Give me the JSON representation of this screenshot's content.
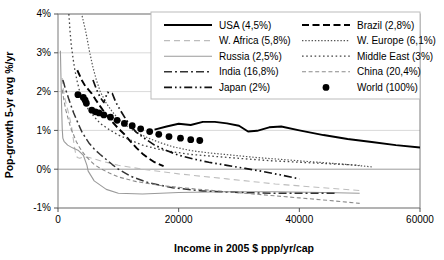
{
  "chart_data": {
    "type": "line",
    "title": "",
    "xlabel": "Income in 2005 $ ppp/yr/cap",
    "ylabel": "Pop-growth 5-yr avg %/yr",
    "xlim": [
      0,
      60000
    ],
    "ylim": [
      -1,
      4
    ],
    "xticks": [
      0,
      20000,
      40000,
      60000
    ],
    "xtick_labels": [
      "0",
      "20000",
      "40000",
      "60000"
    ],
    "yticks": [
      -1,
      0,
      1,
      2,
      3,
      4
    ],
    "ytick_labels": [
      "-1%",
      "0%",
      "1%",
      "2%",
      "3%",
      "4%"
    ],
    "grid": "horizontal",
    "legend_position": "top-right-inside",
    "series": [
      {
        "name": "USA (4,5%)",
        "key": "usa",
        "style": "solid-thick",
        "color": "#000000",
        "points": [
          [
            16000,
            1.02
          ],
          [
            18000,
            1.1
          ],
          [
            20000,
            1.17
          ],
          [
            22000,
            1.14
          ],
          [
            24000,
            1.22
          ],
          [
            26000,
            1.22
          ],
          [
            28000,
            1.18
          ],
          [
            30000,
            1.12
          ],
          [
            31500,
            0.97
          ],
          [
            33000,
            0.99
          ],
          [
            35000,
            1.08
          ],
          [
            37000,
            1.1
          ],
          [
            40000,
            1.0
          ],
          [
            44000,
            0.88
          ],
          [
            48000,
            0.78
          ],
          [
            52000,
            0.7
          ],
          [
            56000,
            0.62
          ],
          [
            60000,
            0.56
          ]
        ]
      },
      {
        "name": "Brazil (2,8%)",
        "key": "brazil",
        "style": "dashed-thick",
        "color": "#000000",
        "points": [
          [
            3200,
            2.55
          ],
          [
            4000,
            2.28
          ],
          [
            4600,
            2.12
          ],
          [
            5000,
            2.06
          ],
          [
            5600,
            1.95
          ],
          [
            6200,
            1.8
          ],
          [
            7000,
            1.62
          ],
          [
            8000,
            1.4
          ],
          [
            9000,
            1.22
          ],
          [
            10000,
            1.05
          ],
          [
            11000,
            0.9
          ],
          [
            12000,
            0.72
          ],
          [
            13000,
            0.55
          ],
          [
            14000,
            0.4
          ],
          [
            15000,
            0.28
          ],
          [
            16000,
            0.18
          ],
          [
            17500,
            0.08
          ]
        ]
      },
      {
        "name": "W. Africa (5,8%)",
        "key": "wafrica",
        "style": "dashed-light",
        "color": "#bdbdbd",
        "points": [
          [
            700,
            2.35
          ],
          [
            900,
            2.05
          ],
          [
            1100,
            1.85
          ],
          [
            1300,
            1.72
          ],
          [
            1500,
            1.6
          ],
          [
            1700,
            1.48
          ],
          [
            1900,
            1.35
          ],
          [
            2100,
            1.2
          ],
          [
            2300,
            1.05
          ],
          [
            2500,
            0.82
          ],
          [
            2700,
            0.6
          ],
          [
            2900,
            0.42
          ],
          [
            3200,
            0.3
          ],
          [
            3600,
            0.28
          ],
          [
            4200,
            0.32
          ],
          [
            5200,
            0.3
          ],
          [
            7000,
            0.22
          ],
          [
            10000,
            0.1
          ],
          [
            14000,
            0.0
          ],
          [
            20000,
            -0.12
          ],
          [
            28000,
            -0.25
          ],
          [
            36000,
            -0.38
          ],
          [
            44000,
            -0.48
          ],
          [
            50000,
            -0.55
          ]
        ]
      },
      {
        "name": "W. Europe (6,1%)",
        "key": "weurope",
        "style": "dotted-fine",
        "color": "#555555",
        "points": [
          [
            4000,
            3.95
          ],
          [
            4600,
            3.55
          ],
          [
            5200,
            3.05
          ],
          [
            5800,
            2.62
          ],
          [
            6400,
            2.28
          ],
          [
            7000,
            2.0
          ],
          [
            8000,
            1.7
          ],
          [
            9000,
            1.48
          ],
          [
            10000,
            1.3
          ],
          [
            11500,
            1.1
          ],
          [
            13000,
            0.95
          ],
          [
            15000,
            0.8
          ],
          [
            17000,
            0.68
          ],
          [
            19000,
            0.58
          ],
          [
            22000,
            0.48
          ],
          [
            25000,
            0.42
          ],
          [
            29000,
            0.36
          ],
          [
            33000,
            0.3
          ],
          [
            38000,
            0.24
          ],
          [
            43000,
            0.18
          ],
          [
            48000,
            0.12
          ],
          [
            52000,
            0.06
          ]
        ]
      },
      {
        "name": "Russia (2,5%)",
        "key": "russia",
        "style": "solid-light",
        "color": "#9a9a9a",
        "points": [
          [
            400,
            3.05
          ],
          [
            500,
            2.3
          ],
          [
            600,
            1.6
          ],
          [
            700,
            1.05
          ],
          [
            800,
            0.8
          ],
          [
            1000,
            0.72
          ],
          [
            1600,
            0.62
          ],
          [
            2400,
            0.55
          ],
          [
            3400,
            0.48
          ],
          [
            4200,
            0.36
          ],
          [
            4800,
            0.1
          ],
          [
            5000,
            -0.05
          ],
          [
            6000,
            -0.3
          ],
          [
            8000,
            -0.52
          ],
          [
            10000,
            -0.62
          ],
          [
            14000,
            -0.64
          ],
          [
            20000,
            -0.6
          ],
          [
            28000,
            -0.58
          ],
          [
            36000,
            -0.58
          ],
          [
            44000,
            -0.6
          ],
          [
            50000,
            -0.62
          ]
        ]
      },
      {
        "name": "Middle East (3%)",
        "key": "mideast",
        "style": "dotted-coarse",
        "color": "#444444",
        "points": [
          [
            1800,
            4.0
          ],
          [
            2000,
            3.55
          ],
          [
            2200,
            3.2
          ],
          [
            2500,
            2.85
          ],
          [
            2800,
            2.55
          ],
          [
            3200,
            2.25
          ],
          [
            3600,
            2.0
          ],
          [
            4200,
            1.78
          ],
          [
            5000,
            1.55
          ],
          [
            6000,
            1.35
          ],
          [
            7000,
            1.18
          ],
          [
            8500,
            1.02
          ],
          [
            10000,
            0.88
          ],
          [
            12000,
            0.75
          ],
          [
            14000,
            0.62
          ],
          [
            16500,
            0.52
          ],
          [
            19000,
            0.45
          ],
          [
            22000,
            0.38
          ],
          [
            26000,
            0.33
          ],
          [
            30000,
            0.28
          ],
          [
            35000,
            0.22
          ],
          [
            40000,
            0.18
          ],
          [
            45000,
            0.14
          ],
          [
            50000,
            0.1
          ]
        ]
      },
      {
        "name": "India (16,8%)",
        "key": "india",
        "style": "dashdot",
        "color": "#333333",
        "points": [
          [
            800,
            2.3
          ],
          [
            1000,
            2.2
          ],
          [
            1200,
            2.08
          ],
          [
            1500,
            1.95
          ],
          [
            1800,
            1.8
          ],
          [
            2200,
            1.62
          ],
          [
            2600,
            1.45
          ],
          [
            3000,
            1.3
          ],
          [
            3500,
            1.12
          ],
          [
            4000,
            0.95
          ],
          [
            4600,
            0.8
          ],
          [
            5200,
            0.66
          ],
          [
            6000,
            0.52
          ],
          [
            7000,
            0.38
          ],
          [
            8000,
            0.25
          ],
          [
            9000,
            0.12
          ],
          [
            10000,
            0.0
          ],
          [
            12000,
            -0.18
          ],
          [
            15000,
            -0.35
          ],
          [
            19000,
            -0.48
          ],
          [
            24000,
            -0.56
          ],
          [
            30000,
            -0.6
          ],
          [
            36000,
            -0.62
          ],
          [
            42000,
            -0.62
          ],
          [
            46000,
            -0.62
          ]
        ]
      },
      {
        "name": "China (20,4%)",
        "key": "china",
        "style": "dashed-fine",
        "color": "#8a8a8a",
        "points": [
          [
            700,
            2.05
          ],
          [
            900,
            1.85
          ],
          [
            1100,
            1.68
          ],
          [
            1300,
            1.52
          ],
          [
            1600,
            1.35
          ],
          [
            1900,
            1.18
          ],
          [
            2200,
            1.02
          ],
          [
            2600,
            0.88
          ],
          [
            3000,
            0.72
          ],
          [
            3500,
            0.58
          ],
          [
            4000,
            0.46
          ],
          [
            4600,
            0.34
          ],
          [
            5200,
            0.24
          ],
          [
            6000,
            0.12
          ],
          [
            7000,
            0.02
          ],
          [
            8500,
            -0.1
          ],
          [
            10000,
            -0.2
          ],
          [
            13000,
            -0.32
          ],
          [
            17000,
            -0.42
          ],
          [
            22000,
            -0.5
          ],
          [
            28000,
            -0.58
          ],
          [
            34000,
            -0.66
          ],
          [
            40000,
            -0.74
          ],
          [
            46000,
            -0.82
          ],
          [
            50000,
            -0.88
          ]
        ]
      },
      {
        "name": "Japan (2%)",
        "key": "japan",
        "style": "dashdotdot",
        "color": "#111111",
        "points": [
          [
            5800,
            2.3
          ],
          [
            6400,
            2.05
          ],
          [
            7000,
            1.85
          ],
          [
            7600,
            1.72
          ],
          [
            8200,
            1.98
          ],
          [
            9000,
            1.95
          ],
          [
            9600,
            1.72
          ],
          [
            10400,
            1.5
          ],
          [
            11200,
            1.3
          ],
          [
            12000,
            1.12
          ],
          [
            13000,
            0.95
          ],
          [
            14500,
            0.78
          ],
          [
            16000,
            0.62
          ],
          [
            18000,
            0.48
          ],
          [
            20000,
            0.36
          ],
          [
            22500,
            0.26
          ],
          [
            25000,
            0.18
          ],
          [
            28000,
            0.1
          ],
          [
            31000,
            0.02
          ],
          [
            34000,
            -0.06
          ],
          [
            37000,
            -0.15
          ],
          [
            40000,
            -0.25
          ]
        ]
      }
    ],
    "scatter": {
      "name": "World (100%)",
      "key": "world",
      "marker": "filled-circle",
      "color": "#000000",
      "points": [
        [
          3300,
          1.92
        ],
        [
          4200,
          1.85
        ],
        [
          4500,
          1.78
        ],
        [
          4700,
          1.7
        ],
        [
          5600,
          1.52
        ],
        [
          6200,
          1.48
        ],
        [
          6800,
          1.45
        ],
        [
          7600,
          1.4
        ],
        [
          8700,
          1.34
        ],
        [
          9800,
          1.26
        ],
        [
          11000,
          1.18
        ],
        [
          12300,
          1.12
        ],
        [
          13700,
          1.04
        ],
        [
          15200,
          0.97
        ],
        [
          16700,
          0.9
        ],
        [
          18400,
          0.84
        ],
        [
          20300,
          0.8
        ],
        [
          22000,
          0.76
        ],
        [
          23500,
          0.74
        ]
      ]
    }
  },
  "legend": {
    "columns": [
      [
        {
          "label": "USA (4,5%)",
          "key": "usa"
        },
        {
          "label": "W. Africa (5,8%)",
          "key": "wafrica"
        },
        {
          "label": "Russia (2,5%)",
          "key": "russia"
        },
        {
          "label": "India (16,8%)",
          "key": "india"
        },
        {
          "label": "Japan (2%)",
          "key": "japan"
        }
      ],
      [
        {
          "label": "Brazil (2,8%)",
          "key": "brazil"
        },
        {
          "label": "W. Europe (6,1%)",
          "key": "weurope"
        },
        {
          "label": "Middle East (3%)",
          "key": "mideast"
        },
        {
          "label": "China (20,4%)",
          "key": "china"
        },
        {
          "label": "World (100%)",
          "key": "world"
        }
      ]
    ]
  }
}
